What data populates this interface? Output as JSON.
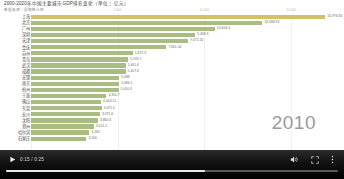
{
  "chart": {
    "title": "2000-2020年中国主要城市GDP排名变化（单位：亿元）",
    "subtitle": "数据来源：国家统计局",
    "year_label": "2010"
  },
  "chart_data": {
    "type": "bar",
    "orientation": "horizontal",
    "title": "2000-2020年中国主要城市GDP排名变化（单位：亿元）",
    "subtitle": "数据来源：国家统计局",
    "xlabel": "",
    "ylabel": "",
    "xlim": [
      0,
      18000
    ],
    "grid": true,
    "legend": "none",
    "annotation_year": "2010",
    "tick_labels": [
      "0",
      "5,000",
      "10,000",
      "15,000"
    ],
    "tick_values": [
      0,
      5000,
      10000,
      15000
    ],
    "colors": {
      "leader": "#d3c164",
      "default": "#a9bd80"
    },
    "categories": [
      "上海",
      "北京",
      "广州",
      "深圳",
      "天津",
      "重庆",
      "苏州",
      "青岛",
      "武汉",
      "成都",
      "无锡",
      "南京",
      "杭州",
      "宁波",
      "佛山",
      "东莞",
      "长沙",
      "沈阳",
      "郑州",
      "哈尔滨",
      "石家庄"
    ],
    "values": [
      16976.84,
      13338.63,
      10604.6,
      9468.3,
      9072.32,
      7801.04,
      5872.3,
      5593.7,
      5461.6,
      5457.6,
      5088,
      5086.1,
      5050.3,
      4350.7,
      4044.51,
      4075.5,
      3975.6,
      3860.6,
      3621.2,
      3365,
      3200
    ],
    "value_labels": [
      "16,976.84",
      "13,338.63",
      "10,604.6",
      "9,468.3",
      "9,072.32",
      "7,801.04",
      "5,872.3",
      "5,593.7",
      "5,461.6",
      "5,457.6",
      "5,088",
      "5,086.1",
      "5,050.3",
      "4,350.7",
      "4,044.51",
      "4,075.5",
      "3,975.6",
      "3,860.6",
      "3,621.2",
      "3,365",
      "3,200"
    ]
  },
  "player": {
    "current_time": "0:15",
    "duration": "0:25",
    "time_display": "0:15 / 0:25",
    "progress_percent": 60,
    "play_icon": "play-icon",
    "volume_icon": "volume-icon",
    "fullscreen_icon": "fullscreen-icon",
    "more_icon": "more-options-icon"
  }
}
